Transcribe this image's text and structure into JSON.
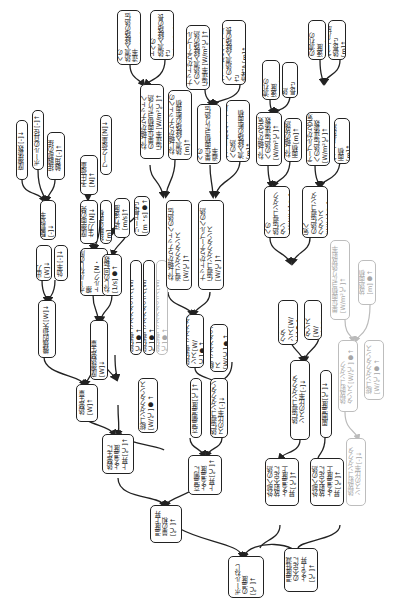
{
  "diagram": {
    "root": {
      "id": "root",
      "label": "ボールねじ\nの温度 [℃]↑"
    },
    "nodes": [
      {
        "id": "n_heat_gen_rise",
        "label": "熱発生に\nよる温度\n上昇 [℃]↑"
      },
      {
        "id": "n_temp_rise_sum",
        "label": "温度上昇\n量の和\n[℃]↑"
      },
      {
        "id": "n_high_temp_rise",
        "label": "高温側に\nよる温度\n上昇 [℃]↑"
      },
      {
        "id": "n_ext_heat_rise",
        "label": "外部への熱\n放射不足に\nよる温度上\n昇 [℃]↑"
      },
      {
        "id": "n_ext_heat_rise2",
        "label": "外部への熱\n放射不足に\nよる温度上\n昇 [℃]↑"
      },
      {
        "id": "n_temp_rise_heatconst",
        "label": "温度低減\nの不足に\nよる上昇\n[℃]↑"
      },
      {
        "id": "n_heat_total",
        "label": "熱発生量\n[W]↑"
      },
      {
        "id": "n_friction_heat",
        "label": "摩擦熱発生量 [W]↓"
      },
      {
        "id": "n_loss_heat",
        "label": "機械的損失 [W]↓"
      },
      {
        "id": "n_power_out",
        "label": "出力 [W]↓"
      },
      {
        "id": "n_efficiency",
        "label": "効率 [-]↓"
      },
      {
        "id": "n_drive_eff",
        "label": "駆動効率 [-]↓"
      },
      {
        "id": "n_ballscrew_torque",
        "label": "ボールねじの摩擦\nトルク [N・m]↑"
      },
      {
        "id": "n_screw_rpm",
        "label": "ねじの回転数\n[1/s]●↑"
      },
      {
        "id": "n_friction_coef",
        "label": "摩擦係数 [-]↓"
      },
      {
        "id": "n_ball_dia",
        "label": "ボールの直径 [-]↑"
      },
      {
        "id": "n_contact_wrap",
        "label": "接触部の接\n触角 [-]↑"
      },
      {
        "id": "n_preload",
        "label": "予圧荷重\n[N]↑"
      },
      {
        "id": "n_work_load",
        "label": "ワーク荷重 [N]↓"
      },
      {
        "id": "n_friction_force",
        "label": "摩擦面の発\n生力 [N]↓"
      },
      {
        "id": "n_contact_area",
        "label": "接触の面積 [m]"
      },
      {
        "id": "n_feed_speed",
        "label": "送り速度\n[m/s]↑"
      },
      {
        "id": "n_lead",
        "label": "リード長さ\n[m・s]●↑"
      },
      {
        "id": "n_heat_cond_a",
        "label": "熱伝導コンダクタンス [W/℃]●↑"
      },
      {
        "id": "n_heat_cond_b",
        "label": "熱伝導コンダクタンス [W/℃]●↑"
      },
      {
        "id": "n_heat_cond_c",
        "label": "熱伝導コンダクタンス [W/℃]●↑"
      },
      {
        "id": "n_total_cond",
        "label": "総コンダクタンス\n[W/℃]●↑"
      },
      {
        "id": "n_screw_nut_cond",
        "label": "ねじ軸からナットへの熱伝\n導コンダクタンス\n[W/℃]↑"
      },
      {
        "id": "n_nut_table_cond",
        "label": "ナットからテーブルへの熱\n伝導コンダクタンス\n[W/℃]↑"
      },
      {
        "id": "n_heat_cond_d",
        "label": "熱伝導コンダクタ\nンス [W/℃]●↑"
      },
      {
        "id": "n_total_cond2",
        "label": "総コンダクタンス\n[W/℃]●↑"
      },
      {
        "id": "n_high_temp_side",
        "label": "高温側温度 [℃]↑"
      },
      {
        "id": "n_cond_ratio",
        "label": "熱伝導コンダクタンスの比率 [-]↓"
      },
      {
        "id": "n_screw_nut_coef",
        "label": "ねじ軸からナットへ\nの単位面積当たり熱\n伝達率 [W/m²℃]↑"
      },
      {
        "id": "n_screw_nut_area",
        "label": "ねじ軸からナットへの\n熱流入経路の断面積\n[m]↑"
      },
      {
        "id": "n_screw_nut_coef2",
        "label": "ねじ軸からナットへの\n熱流入経路の熱伝達率\n[W/m²℃]↑"
      },
      {
        "id": "n_screw_nut_len",
        "label": "ねじ軸からナットへの\n熱流入経路の長さ\n(厚さ) [m]↑"
      },
      {
        "id": "n_nut_table_coef",
        "label": "ナットからテーブルへの\n単位面積当たり熱伝導率\n[W/m²℃]↑"
      },
      {
        "id": "n_nut_table_area",
        "label": "ナットからテーブルへの熱\n流入経路の断面積\n[m]↑"
      },
      {
        "id": "n_nut_table_coef2",
        "label": "ナットからテーブル\nへの熱流入経路の熱\n伝達率 [W/m²℃]↑"
      },
      {
        "id": "n_nut_table_len",
        "label": "ナットからテーブル\nへの熱流入経路の長さ\n(厚さ) [m]↑"
      },
      {
        "id": "n_rad_cond_ratio",
        "label": "熱伝導コンダクタ\nンスの比率 [-]↓"
      },
      {
        "id": "n_ambient_temp",
        "label": "周囲温度 [℃]↓"
      },
      {
        "id": "n_heat_cond_e",
        "label": "熱伝導コンダクタ\nンス [W/℃]●↑"
      },
      {
        "id": "n_total_cond3",
        "label": "総コンダクタンス\n[W/℃]●↑"
      },
      {
        "id": "n_screw_air_cond",
        "label": "ねじ軸から空気への\n熱伝導コンダクタン\nス [W/℃]●↑"
      },
      {
        "id": "n_table_air_cond",
        "label": "テーブルから空気へ\nの熱伝導コンダクタンス\n[W/℃]●↑"
      },
      {
        "id": "n_screw_air_coef",
        "label": "ねじ軸から空気\nへの熱伝達係数\n[W/m²℃]↑"
      },
      {
        "id": "n_screw_rad_area",
        "label": "ねじ軸の放熱\n面積 [m]↑"
      },
      {
        "id": "n_table_air_coef",
        "label": "テーブルから空気\nへの熱伝達係数\n[W/m²℃]↑"
      },
      {
        "id": "n_table_rad_area",
        "label": "テーブル放熱面積\n[m]↑"
      },
      {
        "id": "n_screw_flow",
        "label": "ねじ軸への流れの\n速度 [m/s]↑"
      },
      {
        "id": "n_screw_rad_len",
        "label": "ねじ軸の放熱\n長さ [m]↑"
      },
      {
        "id": "n_table_flow",
        "label": "テーブルへの流れの\n速度 [m/s]↑"
      },
      {
        "id": "n_table_rad_len",
        "label": "テーブル放熱長さ\n[m]↑"
      },
      {
        "id": "n_faint_rad_cond",
        "label": "熱放射コンダク\nタンス [W/℃]●↑"
      },
      {
        "id": "n_faint_total",
        "label": "総コンダクタンス\n[W/℃]●↑"
      },
      {
        "id": "n_faint_ratio",
        "label": "熱放射コンダクタ\nンスの比率 [-]↓"
      },
      {
        "id": "n_faint_unit_coef",
        "label": "単位面積当たり熱放射率\n[W/m²℃]↑"
      },
      {
        "id": "n_faint_area",
        "label": "放熱面積\n[m]●↑"
      }
    ]
  }
}
